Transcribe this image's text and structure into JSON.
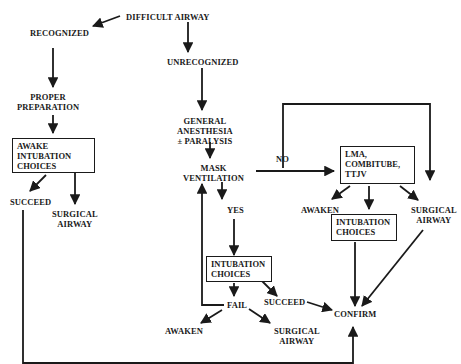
{
  "diagram": {
    "nodes": {
      "difficult_airway": "DIFFICULT AIRWAY",
      "recognized": "RECOGNIZED",
      "unrecognized": "UNRECOGNIZED",
      "proper_preparation": [
        "PROPER",
        "PREPARATION"
      ],
      "awake_intubation_choices": [
        "AWAKE",
        "INTUBATION",
        "CHOICES"
      ],
      "succeed_left": "SUCCEED",
      "surgical_airway_left": [
        "SURGICAL",
        "AIRWAY"
      ],
      "general_anesthesia": [
        "GENERAL",
        "ANESTHESIA",
        "± PARALYSIS"
      ],
      "mask_ventilation": [
        "MASK",
        "VENTILATION"
      ],
      "no": "NO",
      "yes": "YES",
      "lma_box": [
        "LMA,",
        "COMBITUBE,",
        "TTJV"
      ],
      "awaken_right": "AWAKEN",
      "surgical_airway_right": [
        "SURGICAL",
        "AIRWAY"
      ],
      "intubation_choices_right": [
        "INTUBATION",
        "CHOICES"
      ],
      "intubation_choices_mid": [
        "INTUBATION",
        "CHOICES"
      ],
      "succeed_mid": "SUCCEED",
      "fail": "FAIL",
      "confirm": "CONFIRM",
      "awaken_bottom": "AWAKEN",
      "surgical_airway_bottom": [
        "SURGICAL",
        "AIRWAY"
      ]
    },
    "edges": [
      {
        "from": "DIFFICULT AIRWAY",
        "to": "RECOGNIZED"
      },
      {
        "from": "DIFFICULT AIRWAY",
        "to": "UNRECOGNIZED"
      },
      {
        "from": "RECOGNIZED",
        "to": "PROPER PREPARATION"
      },
      {
        "from": "PROPER PREPARATION",
        "to": "AWAKE INTUBATION CHOICES"
      },
      {
        "from": "AWAKE INTUBATION CHOICES",
        "to": "SUCCEED"
      },
      {
        "from": "AWAKE INTUBATION CHOICES",
        "to": "SURGICAL AIRWAY"
      },
      {
        "from": "SUCCEED",
        "to": "CONFIRM"
      },
      {
        "from": "UNRECOGNIZED",
        "to": "GENERAL ANESTHESIA ± PARALYSIS"
      },
      {
        "from": "GENERAL ANESTHESIA ± PARALYSIS",
        "to": "MASK VENTILATION"
      },
      {
        "from": "MASK VENTILATION",
        "to": "LMA, COMBITUBE, TTJV",
        "label": "NO"
      },
      {
        "from": "MASK VENTILATION",
        "to": "SURGICAL AIRWAY",
        "label": "NO"
      },
      {
        "from": "MASK VENTILATION",
        "to": "INTUBATION CHOICES",
        "label": "YES"
      },
      {
        "from": "LMA, COMBITUBE, TTJV",
        "to": "AWAKEN"
      },
      {
        "from": "LMA, COMBITUBE, TTJV",
        "to": "INTUBATION CHOICES"
      },
      {
        "from": "LMA, COMBITUBE, TTJV",
        "to": "SURGICAL AIRWAY"
      },
      {
        "from": "INTUBATION CHOICES",
        "to": "CONFIRM"
      },
      {
        "from": "SURGICAL AIRWAY",
        "to": "CONFIRM"
      },
      {
        "from": "INTUBATION CHOICES",
        "to": "SUCCEED"
      },
      {
        "from": "INTUBATION CHOICES",
        "to": "FAIL"
      },
      {
        "from": "SUCCEED",
        "to": "CONFIRM"
      },
      {
        "from": "FAIL",
        "to": "MASK VENTILATION"
      },
      {
        "from": "FAIL",
        "to": "AWAKEN"
      },
      {
        "from": "FAIL",
        "to": "SURGICAL AIRWAY"
      }
    ]
  }
}
